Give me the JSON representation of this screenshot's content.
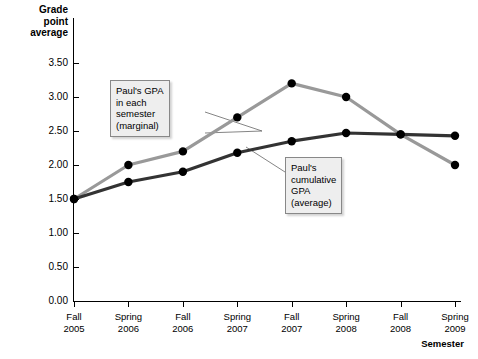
{
  "chart_data": {
    "type": "line",
    "title": "",
    "ylabel": "Grade point average",
    "xlabel": "Semester",
    "categories": [
      "Fall 2005",
      "Spring 2006",
      "Fall 2006",
      "Spring 2007",
      "Fall 2007",
      "Spring 2008",
      "Fall 2008",
      "Spring 2009"
    ],
    "category_lines": [
      [
        "Fall",
        "2005"
      ],
      [
        "Spring",
        "2006"
      ],
      [
        "Fall",
        "2006"
      ],
      [
        "Spring",
        "2007"
      ],
      [
        "Fall",
        "2007"
      ],
      [
        "Spring",
        "2008"
      ],
      [
        "Fall",
        "2008"
      ],
      [
        "Spring",
        "2009"
      ]
    ],
    "ylim": [
      0.0,
      3.5
    ],
    "yticks": [
      0.0,
      0.5,
      1.0,
      1.5,
      2.0,
      2.5,
      3.0,
      3.5
    ],
    "ytick_labels": [
      "0.00",
      "0.50",
      "1.00",
      "1.50",
      "2.00",
      "2.50",
      "3.00",
      "3.50"
    ],
    "grid": false,
    "legend_position": "annotations",
    "series": [
      {
        "name": "Paul's GPA in each semester (marginal)",
        "color": "#999999",
        "marker_color": "#000000",
        "values": [
          1.5,
          2.0,
          2.2,
          2.7,
          3.2,
          3.0,
          2.45,
          2.0
        ]
      },
      {
        "name": "Paul's cumulative GPA (average)",
        "color": "#333333",
        "marker_color": "#000000",
        "values": [
          1.5,
          1.75,
          1.9,
          2.18,
          2.35,
          2.47,
          2.45,
          2.43
        ]
      }
    ],
    "annotations": [
      {
        "id": "marginal",
        "lines": [
          "Paul's GPA",
          "in each",
          "semester",
          "(marginal)"
        ],
        "points_to": "marginal-series"
      },
      {
        "id": "cumulative",
        "lines": [
          "Paul's",
          "cumulative",
          "GPA",
          "(average)"
        ],
        "points_to": "cumulative-series"
      }
    ]
  },
  "axis": {
    "y_title_lines": [
      "Grade",
      "point",
      "average"
    ],
    "x_title": "Semester"
  },
  "colors": {
    "marginal_line": "#999999",
    "cumulative_line": "#333333",
    "marker": "#000000",
    "axis": "#000000",
    "callout_bg": "#eeeeee",
    "callout_border": "#888888"
  }
}
